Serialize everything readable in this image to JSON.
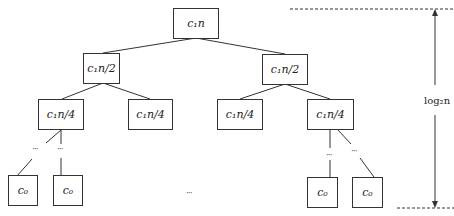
{
  "diagram": {
    "type": "recursion-tree",
    "nodes": {
      "root": "c₁n",
      "l2_left": "c₁n/2",
      "l2_right": "c₁n/2",
      "l3_ll": "c₁n/4",
      "l3_lr": "c₁n/4",
      "l3_rl": "c₁n/4",
      "l3_rr": "c₁n/4",
      "leaf_1": "c₀",
      "leaf_2": "c₀",
      "leaf_3": "c₀",
      "leaf_4": "c₀"
    },
    "ellipsis": "···",
    "height_label": "log₂n"
  }
}
